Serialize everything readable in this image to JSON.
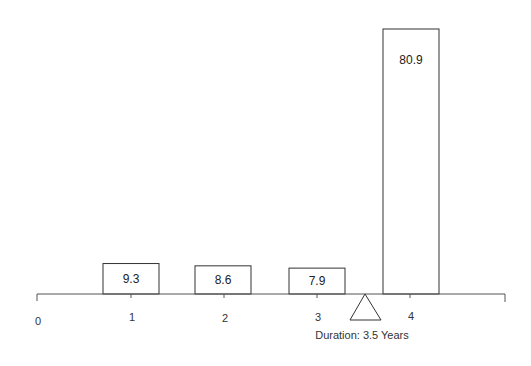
{
  "chart_data": {
    "type": "bar",
    "title": "",
    "xlabel": "",
    "ylabel": "",
    "categories": [
      "1",
      "2",
      "3",
      "4"
    ],
    "values": [
      9.3,
      8.6,
      7.9,
      80.9
    ],
    "value_labels": [
      "9.3",
      "8.6",
      "7.9",
      "80.9"
    ],
    "x_ticks": [
      "0",
      "1",
      "2",
      "3",
      "4"
    ],
    "xlim": [
      0,
      5
    ],
    "grid": false,
    "legend": null,
    "annotations": [
      {
        "type": "fulcrum-triangle",
        "x": 3.5,
        "label": "Duration: 3.5 Years"
      }
    ]
  },
  "colors": {
    "bar_fill": "#ffffff",
    "bar_stroke": "#333333",
    "axis": "#555555"
  }
}
